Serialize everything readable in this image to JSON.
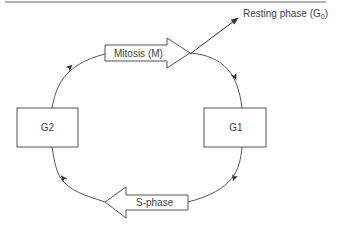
{
  "diagram": {
    "nodes": {
      "g1": {
        "label": "G1"
      },
      "g2": {
        "label": "G2"
      },
      "mitosis": {
        "label": "Mitosis (M)"
      },
      "s_phase": {
        "label": "S-phase"
      },
      "resting": {
        "label": "Resting phase (G",
        "subscript": "0",
        "suffix": ")"
      }
    },
    "edges": [
      {
        "from": "G1",
        "to": "S-phase"
      },
      {
        "from": "S-phase",
        "to": "G2"
      },
      {
        "from": "G2",
        "to": "Mitosis (M)"
      },
      {
        "from": "Mitosis (M)",
        "to": "G1"
      },
      {
        "from": "Mitosis (M)",
        "to": "Resting phase (G0)"
      }
    ],
    "colors": {
      "stroke": "#555555",
      "text": "#444444",
      "rule": "#999999"
    }
  }
}
